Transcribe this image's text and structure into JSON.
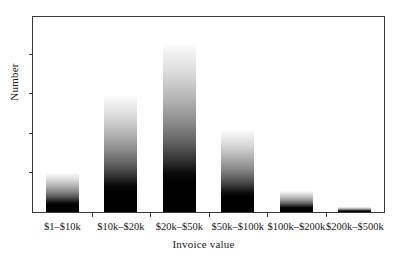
{
  "chart_data": {
    "type": "bar",
    "title": "",
    "xlabel": "Invoice value",
    "ylabel": "Number",
    "categories": [
      "$1–$10k",
      "$10k–$20k",
      "$20k–$50k",
      "$50k–$100k",
      "$100k–$200k",
      "$200k–$500k"
    ],
    "values": [
      39,
      117,
      170,
      83,
      21,
      5
    ],
    "value_unit": "relative bar height (px of 197px plot height)",
    "ylim": [
      0,
      197
    ],
    "y_tick_positions": [
      40,
      80,
      120,
      160
    ],
    "y_tick_labels": [
      "",
      "",
      "",
      ""
    ],
    "grid": false,
    "legend": null,
    "bar_style": {
      "fill": "vertical-gradient-white-to-black",
      "top_color": "#ffffff",
      "bottom_color": "#000000",
      "edge_color": "none"
    },
    "axis_color": "#3a3a3a",
    "background": "#ffffff"
  },
  "figure": {
    "y_axis_label": "Number",
    "x_axis_label": "Invoice value",
    "tick_labels": [
      "$1–$10k",
      "$10k–$20k",
      "$20k–$50k",
      "$50k–$100k",
      "$100k–$200k",
      "$200k–$500k"
    ]
  }
}
